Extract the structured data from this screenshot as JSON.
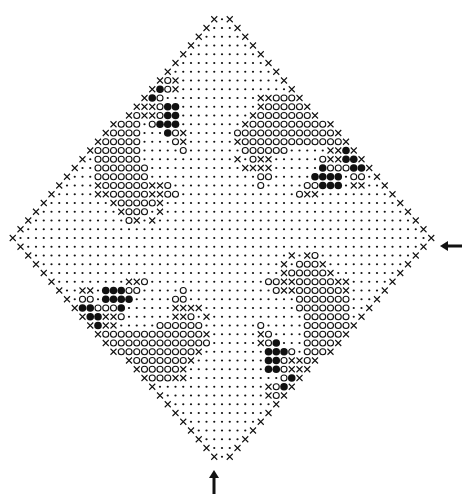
{
  "diagram": {
    "title": "",
    "type": "crochet-filet-chart",
    "legend_symbols": {
      "dot": "·",
      "cross": "X",
      "circle": "O",
      "filled": "●"
    },
    "colors": {
      "ink": "#111111",
      "background": "#ffffff"
    },
    "grid": {
      "center_x": 222,
      "center_y": 238,
      "col_pitch": 7.75,
      "row_pitch": 8.75,
      "half_cols": 27,
      "half_rows": 25
    },
    "arrows": [
      {
        "name": "right-start-arrow",
        "direction": "left",
        "x": 440,
        "y": 246
      },
      {
        "name": "bottom-start-arrow",
        "direction": "up",
        "x": 214,
        "y": 470
      }
    ],
    "motif": [
      "................................",
      "................................",
      "........OXXOO●●●●OX.............",
      "........OOXO●●●●●OX.............",
      "........OOO●●●●●O...............",
      "........OOOOOOXXO●●.............",
      "........OOOOOOXXO●●.............",
      "........OOOOOO.O●●●.............",
      "........OOOOOO...●OX............",
      "........OOOOOO....OX............",
      "........OOOOOO.....O............",
      "........OOOOOO..................",
      "........OOOOOOO.................",
      "........OOOOOOO.................",
      "........XOOOOOOXXO..............",
      "........XXOOOOOXXOO.............",
      "..........XOOOOOX...............",
      "...........XOOO.X...............",
      "............OX.X................",
      "................................"
    ]
  }
}
